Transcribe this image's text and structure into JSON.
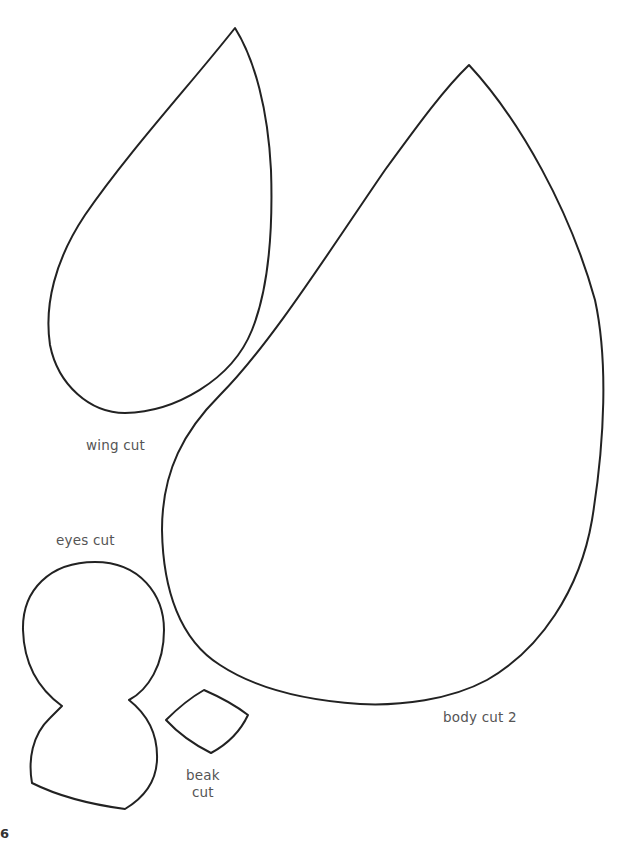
{
  "header": {
    "fragment": ""
  },
  "pieces": [
    {
      "id": "wing",
      "label": "wing cut"
    },
    {
      "id": "body",
      "label": "body cut 2"
    },
    {
      "id": "eyes",
      "label": "eyes cut"
    },
    {
      "id": "beak",
      "label_line1": "beak",
      "label_line2": "cut"
    }
  ],
  "footer": {
    "page_fragment": "6"
  },
  "colors": {
    "outline": "#222222",
    "label": "#555555",
    "background": "#ffffff"
  }
}
